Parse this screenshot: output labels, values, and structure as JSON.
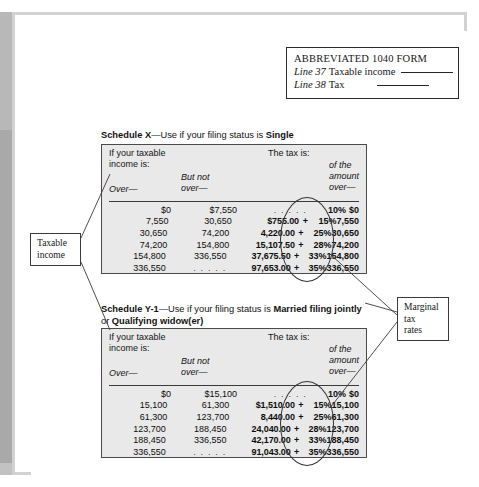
{
  "form1040": {
    "title": "ABBREVIATED 1040 FORM",
    "line37_label": "Line 37",
    "line37_text": "Taxable income",
    "line38_label": "Line 38",
    "line38_text": "Tax"
  },
  "callouts": {
    "taxable_income": "Taxable\nincome",
    "taxable_income_l1": "Taxable",
    "taxable_income_l2": "income",
    "marginal_l1": "Marginal",
    "marginal_l2": "tax",
    "marginal_l3": "rates"
  },
  "schedules": [
    {
      "id": "X",
      "caption_prefix": "Schedule X",
      "caption_middle": "—Use if your filing status is ",
      "caption_status": "Single",
      "headers": {
        "if_taxable_l1": "If your taxable",
        "if_taxable_l2": "income is:",
        "the_tax_is": "The tax is:",
        "but_not_l1": "But not",
        "but_not_l2": "over—",
        "over": "Over—",
        "of_the_l1": "of the",
        "of_the_l2": "amount",
        "of_the_l3": "over—"
      },
      "rows": [
        {
          "over": "$0",
          "but_not_over": "$7,550",
          "base": ". . . . .",
          "plus": "",
          "pct": "10%",
          "amount_over": "$0"
        },
        {
          "over": "7,550",
          "but_not_over": "30,650",
          "base": "$755.00",
          "plus": "+",
          "pct": "15%",
          "amount_over": "7,550"
        },
        {
          "over": "30,650",
          "but_not_over": "74,200",
          "base": "4,220.00",
          "plus": "+",
          "pct": "25%",
          "amount_over": "30,650"
        },
        {
          "over": "74,200",
          "but_not_over": "154,800",
          "base": "15,107.50",
          "plus": "+",
          "pct": "28%",
          "amount_over": "74,200"
        },
        {
          "over": "154,800",
          "but_not_over": "336,550",
          "base": "37,675.50",
          "plus": "+",
          "pct": "33%",
          "amount_over": "154,800"
        },
        {
          "over": "336,550",
          "but_not_over": ". . . . .",
          "base": "97,653.00",
          "plus": "+",
          "pct": "35%",
          "amount_over": "336,550"
        }
      ]
    },
    {
      "id": "Y-1",
      "caption_prefix": "Schedule Y-1",
      "caption_middle": "—Use if your filing status is ",
      "caption_status": "Married filing jointly",
      "caption_or": " or ",
      "caption_status2": "Qualifying widow(er)",
      "headers": {
        "if_taxable_l1": "If your taxable",
        "if_taxable_l2": "income is:",
        "the_tax_is": "The tax is:",
        "but_not_l1": "But not",
        "but_not_l2": "over—",
        "over": "Over—",
        "of_the_l1": "of the",
        "of_the_l2": "amount",
        "of_the_l3": "over—"
      },
      "rows": [
        {
          "over": "$0",
          "but_not_over": "$15,100",
          "base": ". . . . .",
          "plus": "",
          "pct": "10%",
          "amount_over": "$0"
        },
        {
          "over": "15,100",
          "but_not_over": "61,300",
          "base": "$1,510.00",
          "plus": "+",
          "pct": "15%",
          "amount_over": "15,100"
        },
        {
          "over": "61,300",
          "but_not_over": "123,700",
          "base": "8,440.00",
          "plus": "+",
          "pct": "25%",
          "amount_over": "61,300"
        },
        {
          "over": "123,700",
          "but_not_over": "188,450",
          "base": "24,040.00",
          "plus": "+",
          "pct": "28%",
          "amount_over": "123,700"
        },
        {
          "over": "188,450",
          "but_not_over": "336,550",
          "base": "42,170.00",
          "plus": "+",
          "pct": "33%",
          "amount_over": "188,450"
        },
        {
          "over": "336,550",
          "but_not_over": ". . . . .",
          "base": "91,043.00",
          "plus": "+",
          "pct": "35%",
          "amount_over": "336,550"
        }
      ]
    }
  ],
  "colors": {
    "table_fill": "#e9e9e9",
    "table_border": "#4a4a4a",
    "page_shadow": "#b8b8b8",
    "text": "#121212"
  }
}
